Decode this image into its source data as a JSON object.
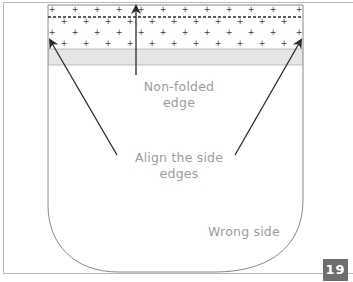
{
  "diagram": {
    "labels": {
      "non_folded_line1": "Non-folded",
      "non_folded_line2": "edge",
      "align_line1": "Align the side",
      "align_line2": "edges",
      "wrong_side": "Wrong side"
    },
    "page_number": "19",
    "colors": {
      "outline": "#7a7a7a",
      "arrow": "#2a2a2a",
      "band": "#e6e6e6",
      "label_text": "#9c9c9c",
      "badge_bg": "#6e6e6e",
      "badge_text": "#ffffff"
    }
  }
}
